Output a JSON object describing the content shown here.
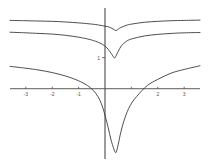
{
  "figure": {
    "title": "",
    "background_color": "#ffffff",
    "axis_color": "#4a4a4a",
    "curve_color": "#3a3a3a",
    "tick_label_color": "#555555",
    "width": 208,
    "height": 167
  },
  "chart_data": {
    "type": "line",
    "title": "",
    "xlabel": "",
    "ylabel": "",
    "xlim": [
      -3.6,
      3.6
    ],
    "ylim": [
      -2.2,
      2.6
    ],
    "grid": false,
    "legend": "none",
    "x_ticks": [
      -3,
      -2,
      -1,
      1,
      2,
      3
    ],
    "x_tick_labels": [
      "-3",
      "-2",
      "-1",
      "",
      "2",
      "3"
    ],
    "y_ticks": [
      1
    ],
    "y_tick_labels": [
      "1"
    ],
    "annotations": [
      "three curves each with a downward cusp / singularity just right of x = 0",
      "curves are nearly flat and slowly rising toward both edges"
    ],
    "series": [
      {
        "name": "upper-curve",
        "comment": "shallowest dip, highest on the plot",
        "x": [
          -3.6,
          -3.0,
          -2.5,
          -2.0,
          -1.5,
          -1.0,
          -0.6,
          -0.3,
          -0.1,
          0.1,
          0.25,
          0.35,
          0.42,
          0.5,
          0.6,
          0.8,
          1.0,
          1.5,
          2.0,
          2.5,
          3.0,
          3.6
        ],
        "y": [
          2.2,
          2.19,
          2.18,
          2.17,
          2.15,
          2.12,
          2.09,
          2.06,
          2.03,
          2.0,
          1.95,
          1.9,
          1.87,
          1.92,
          1.97,
          2.04,
          2.08,
          2.14,
          2.17,
          2.19,
          2.2,
          2.21
        ]
      },
      {
        "name": "middle-curve",
        "comment": "deeper V dip reaching near y = 1 at the cusp",
        "x": [
          -3.6,
          -3.0,
          -2.5,
          -2.0,
          -1.5,
          -1.0,
          -0.6,
          -0.3,
          -0.1,
          0.05,
          0.18,
          0.28,
          0.36,
          0.42,
          0.5,
          0.62,
          0.8,
          1.0,
          1.5,
          2.0,
          2.5,
          3.0,
          3.6
        ],
        "y": [
          1.82,
          1.8,
          1.78,
          1.76,
          1.72,
          1.66,
          1.59,
          1.51,
          1.43,
          1.34,
          1.2,
          1.08,
          0.99,
          1.06,
          1.2,
          1.38,
          1.52,
          1.6,
          1.7,
          1.75,
          1.78,
          1.8,
          1.81
        ]
      },
      {
        "name": "lower-curve",
        "comment": "large arc with a deep narrow singular spike below the x axis",
        "x": [
          -3.6,
          -3.0,
          -2.5,
          -2.0,
          -1.5,
          -1.1,
          -0.8,
          -0.55,
          -0.35,
          -0.2,
          -0.08,
          0.02,
          0.12,
          0.22,
          0.3,
          0.36,
          0.42,
          0.5,
          0.6,
          0.75,
          0.95,
          1.2,
          1.6,
          2.0,
          2.5,
          3.0,
          3.6
        ],
        "y": [
          0.72,
          0.66,
          0.6,
          0.52,
          0.41,
          0.29,
          0.17,
          0.03,
          -0.15,
          -0.36,
          -0.62,
          -0.92,
          -1.25,
          -1.62,
          -1.85,
          -2.0,
          -2.05,
          -1.8,
          -1.4,
          -0.95,
          -0.55,
          -0.25,
          0.1,
          0.3,
          0.5,
          0.62,
          0.74
        ]
      }
    ]
  }
}
